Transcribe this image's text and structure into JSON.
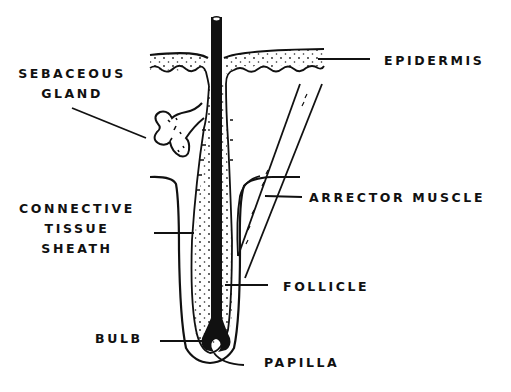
{
  "diagram": {
    "colors": {
      "ink": "#111111",
      "background": "#ffffff"
    },
    "labels": {
      "epidermis": "EPIDERMIS",
      "sebaceous_gland_line1": "SEBACEOUS",
      "sebaceous_gland_line2": "GLAND",
      "arrector_muscle": "ARRECTOR MUSCLE",
      "connective_line1": "CONNECTIVE",
      "connective_line2": "TISSUE",
      "connective_line3": "SHEATH",
      "follicle": "FOLLICLE",
      "bulb": "BULB",
      "papilla": "PAPILLA"
    }
  }
}
